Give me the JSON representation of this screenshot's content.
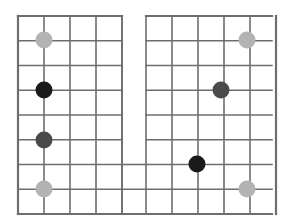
{
  "canvas": {
    "width": 291,
    "height": 224,
    "background": "#ffffff"
  },
  "board": {
    "name": "notched-grid-board",
    "description": "U-shaped notched lattice grid with stones placed on line intersections",
    "line_color": "#6e6e6e",
    "line_width": 1.6,
    "border_color": "#6e6e6e",
    "border_width": 2.2,
    "cell_width": 26,
    "cell_height": 24.75,
    "origin_x": 18,
    "origin_y": 16,
    "columns_total": 10,
    "rows_total": 8,
    "left_block": {
      "name": "left-grid-block",
      "col_start": 0,
      "col_end": 4,
      "row_start": 0,
      "row_end": 8,
      "x": 18,
      "y": 16,
      "width": 104,
      "height": 198
    },
    "right_block": {
      "name": "right-grid-block",
      "col_start": 5,
      "col_end": 10,
      "row_start": 0,
      "row_end": 8,
      "x": 146,
      "y": 16,
      "width": 126,
      "height": 198
    },
    "bridge": {
      "name": "bottom-bridge-region",
      "note": "lower rows span the full width joining the two blocks",
      "row_start": 6,
      "row_end": 8,
      "x": 18,
      "y": 164,
      "width": 254,
      "height": 50
    },
    "notch": {
      "name": "center-notch-gap",
      "x": 122,
      "y": 16,
      "width": 24,
      "height": 148
    }
  },
  "colors": {
    "light_stone": "#b3b3b3",
    "mid_stone": "#4a4a4a",
    "dark_stone": "#1a1a1a",
    "line": "#6e6e6e",
    "background": "#ffffff"
  },
  "stones": [
    {
      "id": "stone-1",
      "label": "light-stone-top-left",
      "cx": 44,
      "cy": 40,
      "r": 8.5,
      "color": "#b3b3b3",
      "shade": "light"
    },
    {
      "id": "stone-2",
      "label": "dark-stone-upper-left",
      "cx": 44,
      "cy": 90,
      "r": 8.5,
      "color": "#1a1a1a",
      "shade": "dark"
    },
    {
      "id": "stone-3",
      "label": "mid-stone-lower-left",
      "cx": 44,
      "cy": 140,
      "r": 8.5,
      "color": "#4a4a4a",
      "shade": "mid"
    },
    {
      "id": "stone-4",
      "label": "light-stone-bottom-left",
      "cx": 44,
      "cy": 189,
      "r": 8.5,
      "color": "#b3b3b3",
      "shade": "light"
    },
    {
      "id": "stone-5",
      "label": "light-stone-top-right",
      "cx": 247,
      "cy": 40,
      "r": 8.5,
      "color": "#b3b3b3",
      "shade": "light"
    },
    {
      "id": "stone-6",
      "label": "mid-stone-upper-right",
      "cx": 221,
      "cy": 90,
      "r": 8.5,
      "color": "#4a4a4a",
      "shade": "mid"
    },
    {
      "id": "stone-7",
      "label": "dark-stone-bottom-center",
      "cx": 197,
      "cy": 164,
      "r": 8.5,
      "color": "#1a1a1a",
      "shade": "dark"
    },
    {
      "id": "stone-8",
      "label": "light-stone-bottom-right",
      "cx": 247,
      "cy": 189,
      "r": 8.5,
      "color": "#b3b3b3",
      "shade": "light"
    }
  ],
  "stone_counts": {
    "light": 4,
    "mid": 2,
    "dark": 2,
    "total": 8
  }
}
